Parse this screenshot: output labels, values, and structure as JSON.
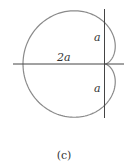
{
  "figure": {
    "caption": "(c)",
    "labels": {
      "horizontal": "2a",
      "upper": "a",
      "lower": "a"
    },
    "colors": {
      "curve": "#8a8a8a",
      "axes": "#444444",
      "text": "#333333"
    },
    "geometry": {
      "cusp_x": 105,
      "cusp_y": 64,
      "a_px": 41
    }
  }
}
